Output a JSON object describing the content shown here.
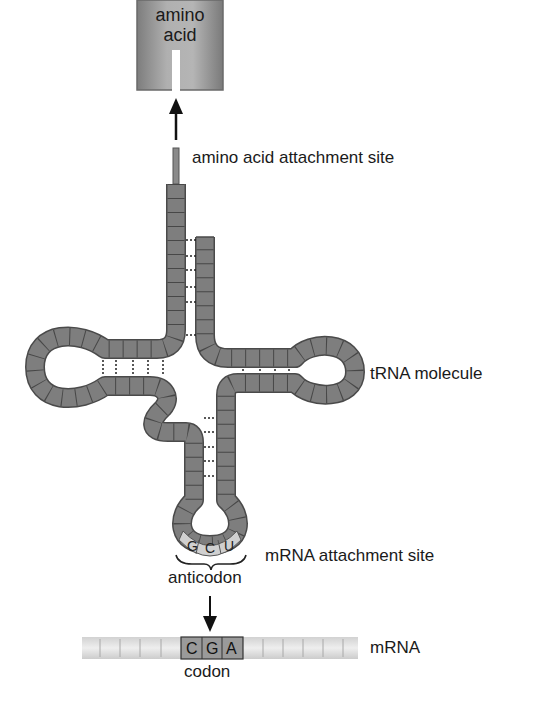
{
  "diagram": {
    "amino_acid": {
      "line1": "amino",
      "line2": "acid"
    },
    "labels": {
      "attachment_site": "amino acid attachment site",
      "trna_molecule": "tRNA molecule",
      "mrna_attachment_site": "mRNA attachment site",
      "anticodon": "anticodon",
      "codon": "codon",
      "mrna": "mRNA"
    },
    "anticodon_bases": [
      "G",
      "C",
      "U"
    ],
    "codon_bases": [
      "C",
      "G",
      "A"
    ],
    "colors": {
      "strand": "#7a7a7a",
      "strand_edge": "#4a4a4a",
      "amino_acid_box": "#8c8c8c",
      "anticodon_fill": "#cfcfcf",
      "mrna_strip": "#e2e2e2",
      "codon_fill": "#9a9a9a",
      "text": "#1a1a1a"
    }
  }
}
